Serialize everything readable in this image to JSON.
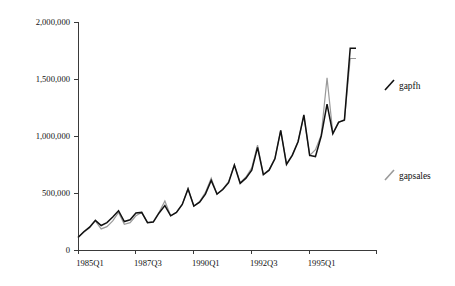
{
  "chart_data": {
    "type": "line",
    "title": "",
    "subtitle": "",
    "xlabel": "",
    "ylabel": "",
    "grid": false,
    "legend_position": "right",
    "ylim": [
      0,
      2000000
    ],
    "ytick_values": [
      0,
      500000,
      1000000,
      1500000,
      2000000
    ],
    "ytick_labels": [
      "0",
      "500,000",
      "1,000,000",
      "1,500,000",
      "2,000,000"
    ],
    "xtick_labels": [
      "1985Q1",
      "1987Q3",
      "1990Q1",
      "1992Q3",
      "1995Q1"
    ],
    "xtick_indices": [
      0,
      10,
      20,
      30,
      40
    ],
    "x": [
      "1985Q1",
      "1985Q2",
      "1985Q3",
      "1985Q4",
      "1986Q1",
      "1986Q2",
      "1986Q3",
      "1986Q4",
      "1987Q1",
      "1987Q2",
      "1987Q3",
      "1987Q4",
      "1988Q1",
      "1988Q2",
      "1988Q3",
      "1988Q4",
      "1989Q1",
      "1989Q2",
      "1989Q3",
      "1989Q4",
      "1990Q1",
      "1990Q2",
      "1990Q3",
      "1990Q4",
      "1991Q1",
      "1991Q2",
      "1991Q3",
      "1991Q4",
      "1992Q1",
      "1992Q2",
      "1992Q3",
      "1992Q4",
      "1993Q1",
      "1993Q2",
      "1993Q3",
      "1993Q4",
      "1994Q1",
      "1994Q2",
      "1994Q3",
      "1994Q4",
      "1995Q1",
      "1995Q2",
      "1995Q3",
      "1995Q4",
      "1996Q1",
      "1996Q2",
      "1996Q3",
      "1996Q4",
      "1997Q1"
    ],
    "series": [
      {
        "name": "gapfh",
        "color": "#111111",
        "values": [
          110000,
          160000,
          200000,
          260000,
          215000,
          240000,
          290000,
          345000,
          250000,
          265000,
          325000,
          330000,
          240000,
          245000,
          325000,
          390000,
          300000,
          330000,
          400000,
          535000,
          385000,
          420000,
          490000,
          610000,
          490000,
          530000,
          590000,
          745000,
          585000,
          630000,
          700000,
          900000,
          660000,
          700000,
          800000,
          1050000,
          750000,
          830000,
          950000,
          1185000,
          830000,
          820000,
          1000000,
          1280000,
          1020000,
          1120000,
          1140000,
          1770000,
          1770000
        ]
      },
      {
        "name": "gapsales",
        "color": "#9a9a9a",
        "values": [
          110000,
          155000,
          195000,
          255000,
          185000,
          205000,
          255000,
          330000,
          225000,
          240000,
          300000,
          330000,
          240000,
          250000,
          330000,
          430000,
          300000,
          330000,
          400000,
          540000,
          385000,
          425000,
          505000,
          630000,
          490000,
          535000,
          600000,
          750000,
          590000,
          640000,
          720000,
          920000,
          665000,
          705000,
          805000,
          1050000,
          755000,
          835000,
          955000,
          1175000,
          830000,
          880000,
          1010000,
          1510000,
          1025000,
          1125000,
          1135000,
          1680000,
          1680000
        ]
      }
    ]
  },
  "legend": {
    "items": [
      {
        "label": "gapfh",
        "color": "#111111"
      },
      {
        "label": "gapsales",
        "color": "#9a9a9a"
      }
    ]
  }
}
